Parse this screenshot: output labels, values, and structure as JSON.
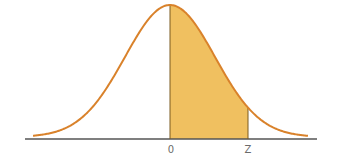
{
  "chart_data": {
    "type": "area",
    "title": "",
    "distribution": "standard normal",
    "mean": 0,
    "shaded_region": {
      "from": "0",
      "to": "Z"
    },
    "x_tick_labels": [
      "0",
      "Z"
    ],
    "xlabel": "",
    "ylabel": "",
    "grid": false,
    "colors": {
      "curve": "#d9822b",
      "fill": "#f0c060",
      "axis": "#555555",
      "divider": "#7a5a20"
    }
  },
  "labels": {
    "zero": "0",
    "z": "Z"
  }
}
